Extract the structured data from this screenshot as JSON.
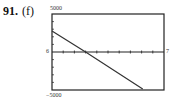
{
  "problem": {
    "number": "91.",
    "part": "(f)"
  },
  "labels": {
    "ymax": "5000",
    "ymin": "−5000",
    "xmin": "6",
    "xmax": "7"
  },
  "chart_data": {
    "type": "line",
    "title": "",
    "xlabel": "",
    "ylabel": "",
    "xlim": [
      0,
      10
    ],
    "ylim": [
      -5000,
      5000
    ],
    "x_tick_count": 10,
    "y_tick_step": 1000,
    "tick_labels": {
      "left_axis_label": "6",
      "right_axis_label": "7",
      "top": "5000",
      "bottom": "-5000"
    },
    "grid": false,
    "series": [
      {
        "name": "line",
        "points": [
          [
            0,
            2760
          ],
          [
            3.0,
            0
          ],
          [
            8.1,
            -4870
          ]
        ]
      }
    ]
  },
  "colors": {
    "frame": "#222222",
    "line": "#333333"
  }
}
